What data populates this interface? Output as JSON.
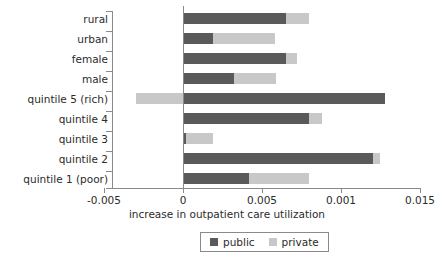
{
  "chart_data": {
    "type": "bar",
    "orientation": "horizontal",
    "stacked": true,
    "title": "",
    "xlabel": "increase in outpatient care utilization",
    "ylabel": "",
    "xlim": [
      -0.005,
      0.015
    ],
    "grid": false,
    "legend_position": "bottom-center",
    "xtick_values": [
      -0.005,
      0,
      0.005,
      0.001,
      0.015
    ],
    "xtick_labels": [
      "-0.005",
      "0",
      "0.005",
      "0.001",
      "0.015"
    ],
    "categories": [
      "rural",
      "urban",
      "female",
      "male",
      "quintile 5 (rich)",
      "quintile 4",
      "quintile 3",
      "quintile 2",
      "quintile 1 (poor)"
    ],
    "series": [
      {
        "name": "public",
        "color": "#5a5a5a",
        "values": [
          0.0065,
          0.0019,
          0.0065,
          0.0032,
          0.0128,
          0.008,
          0.0002,
          0.012,
          0.0042
        ]
      },
      {
        "name": "private",
        "color": "#c8c8c8",
        "values": [
          0.0015,
          0.0039,
          0.0007,
          0.0027,
          -0.003,
          0.0008,
          0.0017,
          0.0005,
          0.0038
        ]
      }
    ],
    "totals": [
      0.008,
      0.0058,
      0.0072,
      0.0059,
      0.0128,
      0.0088,
      0.0019,
      0.0125,
      0.008
    ]
  },
  "legend": {
    "items": [
      {
        "label": "public",
        "swatch": "public-swatch"
      },
      {
        "label": "private",
        "swatch": "private-swatch"
      }
    ]
  },
  "axes": {
    "x_title": "increase in outpatient care utilization"
  }
}
